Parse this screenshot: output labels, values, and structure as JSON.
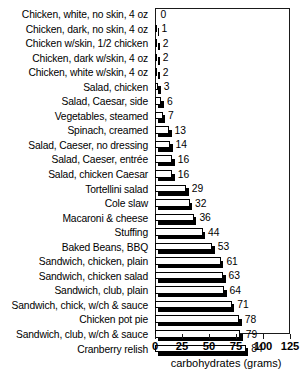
{
  "chart_data": {
    "type": "bar",
    "orientation": "horizontal",
    "title": "",
    "xlabel": "carbohydrates (grams)",
    "ylabel": "",
    "xlim": [
      0,
      125
    ],
    "xticks": [
      0,
      25,
      50,
      75,
      100,
      125
    ],
    "grid": false,
    "legend": null,
    "value_labels": true,
    "categories": [
      "Chicken, white, no skin, 4 oz",
      "Chicken, dark, no skin, 4 oz",
      "Chicken w/skin, 1/2 chicken",
      "Chicken, dark w/skin, 4 oz",
      "Chicken, white w/skin, 4 oz",
      "Salad, chicken",
      "Salad, Caesar, side",
      "Vegetables, steamed",
      "Spinach, creamed",
      "Salad, Caeser, no dressing",
      "Salad, Caeser, entrée",
      "Salad, chicken Caesar",
      "Tortellini salad",
      "Cole slaw",
      "Macaroni & cheese",
      "Stuffing",
      "Baked Beans, BBQ",
      "Sandwich, chicken, plain",
      "Sandwich, chicken salad",
      "Sandwich, club, plain",
      "Sandwich, chick, w/ch & sauce",
      "Chicken pot pie",
      "Sandwich, club, w/ch & sauce",
      "Cranberry relish"
    ],
    "values": [
      0,
      1,
      2,
      2,
      2,
      3,
      6,
      7,
      13,
      14,
      16,
      16,
      29,
      32,
      36,
      44,
      53,
      61,
      63,
      64,
      71,
      78,
      79,
      84
    ],
    "colors": {
      "bar_face": "#ffffff",
      "bar_outline": "#000000",
      "bar_shadow": "#000000",
      "axis": "#1a1a1a",
      "text": "#000000",
      "background": "#ffffff"
    }
  }
}
